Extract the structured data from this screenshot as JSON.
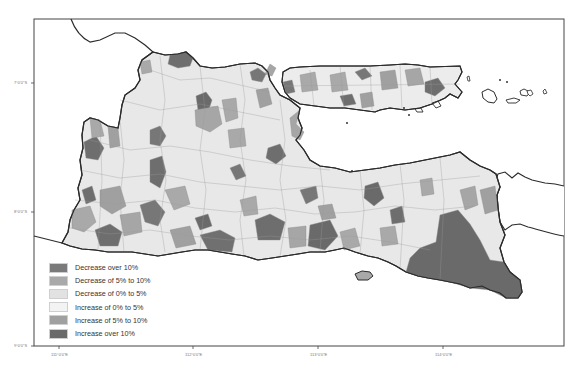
{
  "map": {
    "title": "",
    "region": "East Java and Madura",
    "frame": {
      "left": 34,
      "top": 19,
      "right": 564,
      "bottom": 346
    },
    "axes": {
      "y_ticks": [
        {
          "label": "7°0'0\"S",
          "y": 83
        },
        {
          "label": "8°0'0\"S",
          "y": 212
        },
        {
          "label": "9°0'0\"S",
          "y": 346
        }
      ],
      "x_ticks": [
        {
          "label": "111°0'0\"E",
          "x": 59
        },
        {
          "label": "112°0'0\"E",
          "x": 193
        },
        {
          "label": "113°0'0\"E",
          "x": 318
        },
        {
          "label": "114°0'0\"E",
          "x": 443
        }
      ]
    },
    "legend": {
      "items": [
        {
          "label": "Decrease over 10%",
          "color": "#7a7a7a"
        },
        {
          "label": "Decrease of 5% to 10%",
          "color": "#a9a9a9"
        },
        {
          "label": "Decrease of 0% to 5%",
          "color": "#e2e2e2"
        },
        {
          "label": "Increase of 0% to 5%",
          "color": "#f3f3f3"
        },
        {
          "label": "Increase of 5% to 10%",
          "color": "#a0a0a0"
        },
        {
          "label": "Increase over 10%",
          "color": "#6a6a6a"
        }
      ]
    },
    "colors": {
      "background": "#ffffff",
      "coastline": "#2b2b2b",
      "boundary": "#8a8a8a"
    }
  }
}
